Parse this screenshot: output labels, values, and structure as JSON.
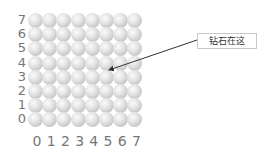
{
  "diagram": {
    "rows": 8,
    "cols": 8,
    "row_labels": [
      "7",
      "6",
      "5",
      "4",
      "3",
      "2",
      "1",
      "0"
    ],
    "col_labels": [
      "0",
      "1",
      "2",
      "3",
      "4",
      "5",
      "6",
      "7"
    ],
    "callout": {
      "text": "钻石在这",
      "target_col": 5,
      "target_row": 4
    },
    "colors": {
      "label": "#777777",
      "arrow": "#333333",
      "sphere": "#d0d0d0"
    }
  }
}
